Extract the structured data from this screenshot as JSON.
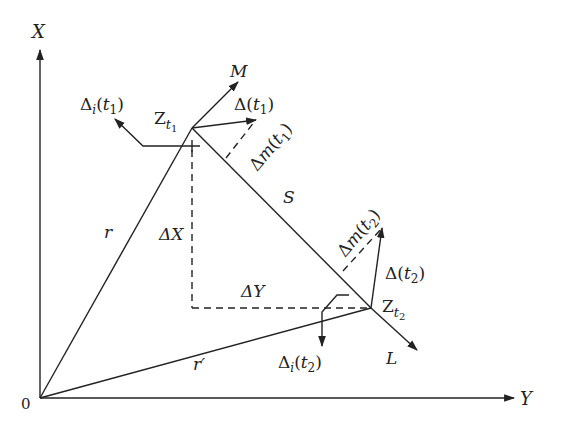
{
  "diagram": {
    "axes": {
      "x_label": "X",
      "y_label": "Y",
      "origin_label": "0"
    },
    "vectors": {
      "r": "r",
      "r_prime": "r′",
      "S": "S",
      "M": "M",
      "L": "L"
    },
    "points": {
      "z_t1": {
        "base": "Z",
        "sub": "t",
        "subsub": "1"
      },
      "z_t2": {
        "base": "Z",
        "sub": "t",
        "subsub": "2"
      }
    },
    "deltas": {
      "delta_x": "ΔX",
      "delta_y": "ΔY",
      "delta_t1": {
        "head": "Δ(",
        "var": "t",
        "sub": "1",
        "tail": ")"
      },
      "delta_t2": {
        "head": "Δ(",
        "var": "t",
        "sub": "2",
        "tail": ")"
      },
      "delta_i_t1": {
        "head": "Δ",
        "isub": "i",
        "open": "(",
        "var": "t",
        "sub": "1",
        "tail": ")"
      },
      "delta_i_t2": {
        "head": "Δ",
        "isub": "i",
        "open": "(",
        "var": "t",
        "sub": "2",
        "tail": ")"
      },
      "delta_m_t1": {
        "head": "Δ",
        "m": "m",
        "open": "(",
        "var": "t",
        "sub": "1",
        "tail": ")"
      },
      "delta_m_t2": {
        "head": "Δ",
        "m": "m",
        "open": "(",
        "var": "t",
        "sub": "2",
        "tail": ")"
      }
    },
    "colors": {
      "stroke": "#222222",
      "background": "#ffffff"
    }
  }
}
